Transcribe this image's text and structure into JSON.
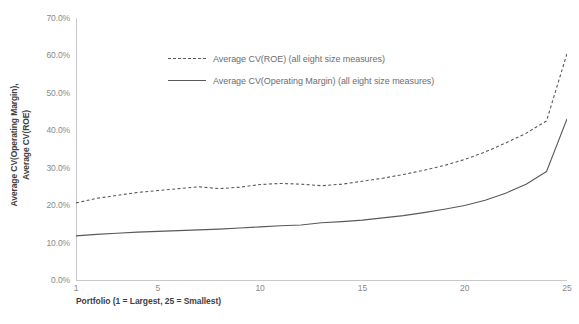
{
  "chart_data": {
    "type": "line",
    "title": "",
    "xlabel": "Portfolio (1 = Largest, 25 = Smallest)",
    "ylabel": "Average CV(Operating Margin), Average CV(ROE)",
    "ylabel_line1": "Average CV(Operating Margin),",
    "ylabel_line2": "Average CV(ROE)",
    "grid": false,
    "legend_position": "upper-left-inside",
    "xlim": [
      1,
      25
    ],
    "ylim": [
      0,
      70
    ],
    "yticks": [
      0,
      10,
      20,
      30,
      40,
      50,
      60,
      70
    ],
    "ytick_labels": [
      "0.0%",
      "10.0%",
      "20.0%",
      "30.0%",
      "40.0%",
      "50.0%",
      "60.0%",
      "70.0%"
    ],
    "xticks": [
      1,
      5,
      10,
      15,
      20,
      25
    ],
    "xtick_labels": [
      "1",
      "5",
      "10",
      "15",
      "20",
      "25"
    ],
    "x": [
      1,
      2,
      3,
      4,
      5,
      6,
      7,
      8,
      9,
      10,
      11,
      12,
      13,
      14,
      15,
      16,
      17,
      18,
      19,
      20,
      21,
      22,
      23,
      24,
      25
    ],
    "series": [
      {
        "name": "Average CV(ROE) (all eight size measures)",
        "style": "dashed",
        "color": "#595959",
        "values": [
          20.6,
          21.8,
          22.6,
          23.4,
          23.9,
          24.4,
          24.9,
          24.4,
          24.8,
          25.5,
          25.8,
          25.6,
          25.2,
          25.6,
          26.4,
          27.2,
          28.2,
          29.3,
          30.6,
          32.2,
          34.2,
          36.6,
          39.2,
          42.5,
          60.5
        ]
      },
      {
        "name": "Average CV(Operating Margin) (all eight size measures)",
        "style": "solid",
        "color": "#595959",
        "values": [
          11.8,
          12.2,
          12.5,
          12.8,
          13.0,
          13.2,
          13.4,
          13.6,
          13.9,
          14.2,
          14.5,
          14.7,
          15.3,
          15.6,
          16.0,
          16.6,
          17.2,
          18.0,
          18.9,
          19.9,
          21.3,
          23.2,
          25.6,
          29.0,
          43.0
        ]
      }
    ]
  },
  "axes": {
    "y_title_line1": "Average CV(Operating Margin),",
    "y_title_line2": "Average CV(ROE)",
    "x_title": "Portfolio (1 = Largest, 25 = Smallest)"
  },
  "legend": {
    "items": [
      {
        "label": "Average CV(ROE) (all eight size measures)",
        "style": "dashed"
      },
      {
        "label": "Average CV(Operating Margin) (all eight size measures)",
        "style": "solid"
      }
    ]
  },
  "colors": {
    "line": "#595959",
    "axis": "#c9c9c9",
    "tick_text": "#8a8a8a",
    "title_text": "#3f3f3f",
    "legend_text": "#6e6e6e",
    "background": "#ffffff"
  }
}
